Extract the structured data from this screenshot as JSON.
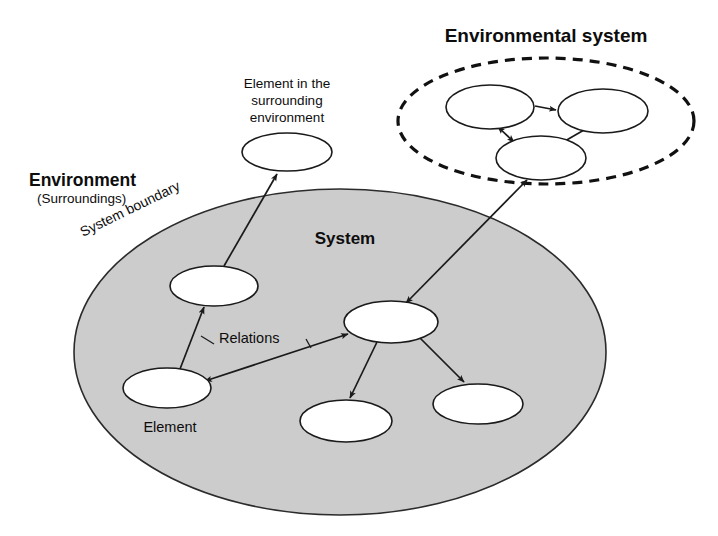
{
  "diagram": {
    "title_environmental_system": "Environmental system",
    "label_environment": "Environment",
    "label_surroundings": "(Surroundings)",
    "label_system_boundary": "System boundary",
    "label_system": "System",
    "label_element_in_surrounding_environment_line1": "Element in the",
    "label_element_in_surrounding_environment_line2": "surrounding",
    "label_element_in_surrounding_environment_line3": "environment",
    "label_relations": "Relations",
    "label_element": "Element",
    "colors": {
      "system_fill": "#cccccc",
      "element_fill": "#ffffff",
      "stroke": "#1a1a1a",
      "text": "#0d0d0d",
      "background": "#ffffff"
    },
    "nodes": {
      "system_boundary_ellipse": {
        "cx": 340,
        "cy": 352,
        "rx": 266,
        "ry": 163
      },
      "environmental_boundary_ellipse": {
        "cx": 546,
        "cy": 121,
        "rx": 148,
        "ry": 63
      },
      "external_element": {
        "cx": 287,
        "cy": 152,
        "rx": 45,
        "ry": 19
      },
      "env_node_top_left": {
        "cx": 490,
        "cy": 107,
        "rx": 44,
        "ry": 22
      },
      "env_node_top_right": {
        "cx": 603,
        "cy": 111,
        "rx": 45,
        "ry": 22
      },
      "env_node_bottom": {
        "cx": 541,
        "cy": 158,
        "rx": 45,
        "ry": 22
      },
      "sys_node_upper_left": {
        "cx": 214,
        "cy": 286,
        "rx": 44,
        "ry": 20
      },
      "sys_node_element": {
        "cx": 167,
        "cy": 388,
        "rx": 44,
        "ry": 20
      },
      "sys_node_center": {
        "cx": 391,
        "cy": 322,
        "rx": 47,
        "ry": 21
      },
      "sys_node_bottom_mid": {
        "cx": 346,
        "cy": 421,
        "rx": 46,
        "ry": 21
      },
      "sys_node_bottom_right": {
        "cx": 478,
        "cy": 404,
        "rx": 45,
        "ry": 20
      }
    },
    "edges": [
      {
        "name": "element-to-external-environment",
        "from": "sys_node_upper_left",
        "to": "external_element",
        "arrow": "single"
      },
      {
        "name": "element-to-upper-left",
        "from": "sys_node_element",
        "to": "sys_node_upper_left",
        "arrow": "single"
      },
      {
        "name": "center-to-element-relations",
        "from": "sys_node_center",
        "to": "sys_node_element",
        "arrow": "double"
      },
      {
        "name": "center-to-bottom-mid",
        "from": "sys_node_center",
        "to": "sys_node_bottom_mid",
        "arrow": "single"
      },
      {
        "name": "center-to-bottom-right",
        "from": "sys_node_center",
        "to": "sys_node_bottom_right",
        "arrow": "single"
      },
      {
        "name": "center-to-environmental-system",
        "from": "sys_node_center",
        "to": "env_node_bottom",
        "arrow": "double"
      },
      {
        "name": "env-top-left-to-top-right",
        "from": "env_node_top_left",
        "to": "env_node_top_right",
        "arrow": "single"
      },
      {
        "name": "env-top-right-to-bottom",
        "from": "env_node_top_right",
        "to": "env_node_bottom",
        "arrow": "single"
      },
      {
        "name": "env-bottom-to-top-left",
        "from": "env_node_bottom",
        "to": "env_node_top_left",
        "arrow": "double"
      }
    ]
  }
}
